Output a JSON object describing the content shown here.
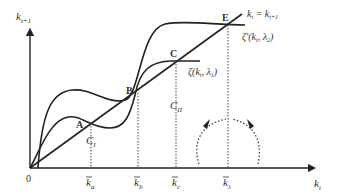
{
  "diagram": {
    "type": "economic phase diagram",
    "axes": {
      "y_label_base": "k",
      "y_label_sub": "t+1",
      "x_label_base": "k",
      "x_label_sub": "t",
      "origin": "0"
    },
    "points": {
      "A": "A",
      "B": "B",
      "C": "C",
      "E": "E"
    },
    "curve_labels": {
      "identity_base": "k",
      "identity_sub1": "t",
      "identity_eq": " = k",
      "identity_sub2": "t+1",
      "zeta_prime": "ζ'(k",
      "zeta_prime_sub": "t",
      "zeta_prime_rest": ", λ",
      "zeta_prime_sub2": "2",
      "zeta_prime_close": ")",
      "zeta": "ζ(k",
      "zeta_sub": "t",
      "zeta_rest": ", λ",
      "zeta_sub2": "1",
      "zeta_close": ")"
    },
    "cluster_labels": {
      "C1": "C",
      "C1_sub": "I",
      "C2": "C",
      "C2_sub": "II"
    },
    "x_ticks": [
      {
        "base": "k",
        "sub": "a"
      },
      {
        "base": "k",
        "sub": "b"
      },
      {
        "base": "k",
        "sub": "c"
      },
      {
        "base": "k",
        "sub": "λ"
      }
    ],
    "colors": {
      "line": "#222222",
      "text": "#333333"
    }
  }
}
